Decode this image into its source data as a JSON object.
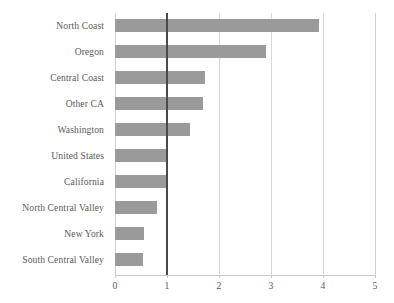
{
  "chart_data": {
    "type": "bar",
    "orientation": "horizontal",
    "title": "",
    "subtitle": "",
    "xlabel": "",
    "ylabel": "",
    "xlim": [
      0,
      5
    ],
    "xticks": [
      "0",
      "1",
      "2",
      "3",
      "4",
      "5"
    ],
    "grid": true,
    "legend": null,
    "reference_line": {
      "value": 1,
      "color": "#4a4a4a",
      "label": ""
    },
    "bar_color": "#9a9a9a",
    "categories": [
      "North Coast",
      "Oregon",
      "Central Coast",
      "Other CA",
      "Washington",
      "United States",
      "California",
      "North Central Valley",
      "New York",
      "South Central Valley"
    ],
    "values": [
      3.92,
      2.9,
      1.73,
      1.7,
      1.45,
      1.0,
      1.0,
      0.81,
      0.55,
      0.54
    ]
  }
}
